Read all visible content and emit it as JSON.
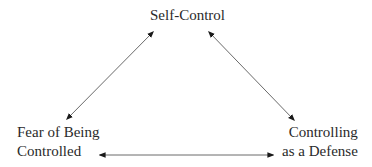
{
  "diagram": {
    "type": "triangle-cycle",
    "nodes": [
      {
        "id": "self-control",
        "lines": [
          "Self-Control"
        ],
        "position": "top"
      },
      {
        "id": "fear-of-being-controlled",
        "lines": [
          "Fear of Being",
          "Controlled"
        ],
        "position": "bottom-left"
      },
      {
        "id": "controlling-as-defense",
        "lines": [
          "Controlling",
          "as a Defense"
        ],
        "position": "bottom-right"
      }
    ],
    "edges": [
      {
        "from": "self-control",
        "to": "fear-of-being-controlled",
        "direction": "bidirectional"
      },
      {
        "from": "self-control",
        "to": "controlling-as-defense",
        "direction": "bidirectional"
      },
      {
        "from": "fear-of-being-controlled",
        "to": "controlling-as-defense",
        "direction": "bidirectional"
      }
    ],
    "colors": {
      "text": "#2a2a2a",
      "arrow": "#6a6a6a",
      "arrowhead": "#1a1a1a",
      "background": "#ffffff"
    }
  }
}
